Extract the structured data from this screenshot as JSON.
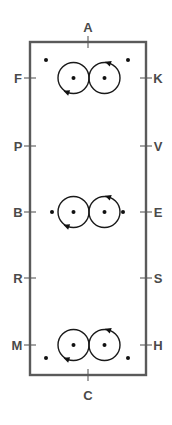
{
  "diagram": {
    "title_top_label": "A",
    "title_bottom_label": "C",
    "frame": {
      "x": 30,
      "y": 42,
      "width": 116,
      "height": 333,
      "stroke_color": "#5a5a5a",
      "stroke_width": 2.4
    },
    "colors": {
      "frame": "#5a5a5a",
      "label_text": "#4a4a4a",
      "circle_stroke": "#1a1a1a",
      "dot_fill": "#111111",
      "background": "#ffffff"
    },
    "edge_markers": [
      {
        "name": "top-marker-A",
        "label": "A",
        "side": "top",
        "x": 88,
        "y": 42,
        "label_x": 88,
        "label_y": 32
      },
      {
        "name": "bottom-marker-C",
        "label": "C",
        "side": "bottom",
        "x": 88,
        "y": 375,
        "label_x": 88,
        "label_y": 400
      }
    ],
    "left_markers": [
      {
        "name": "left-marker-F",
        "label": "F",
        "y": 78,
        "label_x": 18,
        "label_y": 83
      },
      {
        "name": "left-marker-P",
        "label": "P",
        "y": 146,
        "label_x": 18,
        "label_y": 151
      },
      {
        "name": "left-marker-B",
        "label": "B",
        "y": 212,
        "label_x": 18,
        "label_y": 217
      },
      {
        "name": "left-marker-R",
        "label": "R",
        "y": 278,
        "label_x": 18,
        "label_y": 283
      },
      {
        "name": "left-marker-M",
        "label": "M",
        "y": 345,
        "label_x": 17,
        "label_y": 350
      }
    ],
    "right_markers": [
      {
        "name": "right-marker-K",
        "label": "K",
        "y": 78,
        "label_x": 158,
        "label_y": 83
      },
      {
        "name": "right-marker-V",
        "label": "V",
        "y": 146,
        "label_x": 158,
        "label_y": 151
      },
      {
        "name": "right-marker-E",
        "label": "E",
        "y": 212,
        "label_x": 158,
        "label_y": 217
      },
      {
        "name": "right-marker-S",
        "label": "S",
        "y": 278,
        "label_x": 158,
        "label_y": 283
      },
      {
        "name": "right-marker-H",
        "label": "H",
        "y": 345,
        "label_x": 158,
        "label_y": 350
      }
    ],
    "circle_pairs": [
      {
        "name": "circle-pair-top",
        "row_label_left": "F",
        "row_label_right": "K",
        "cy": 78,
        "left_circle": {
          "cx": 73.5,
          "cy": 78,
          "r": 15.5,
          "center_dot": true,
          "rotation": "clockwise",
          "arrow_angle_deg": 110
        },
        "right_circle": {
          "cx": 104.5,
          "cy": 78,
          "r": 15.5,
          "center_dot": true,
          "rotation": "counterclockwise",
          "arrow_angle_deg": 290
        }
      },
      {
        "name": "circle-pair-middle",
        "row_label_left": "B",
        "row_label_right": "E",
        "cy": 212,
        "left_circle": {
          "cx": 73.5,
          "cy": 212,
          "r": 15.5,
          "center_dot": true,
          "rotation": "clockwise",
          "arrow_angle_deg": 110
        },
        "right_circle": {
          "cx": 104.5,
          "cy": 212,
          "r": 15.5,
          "center_dot": true,
          "rotation": "counterclockwise",
          "arrow_angle_deg": 290
        }
      },
      {
        "name": "circle-pair-bottom",
        "row_label_left": "M",
        "row_label_right": "H",
        "cy": 345,
        "left_circle": {
          "cx": 73.5,
          "cy": 345,
          "r": 15.5,
          "center_dot": true,
          "rotation": "clockwise",
          "arrow_angle_deg": 110
        },
        "right_circle": {
          "cx": 104.5,
          "cy": 345,
          "r": 15.5,
          "center_dot": true,
          "rotation": "counterclockwise",
          "arrow_angle_deg": 290
        }
      }
    ],
    "free_dots": [
      {
        "name": "free-dot-top-left",
        "cx": 46,
        "cy": 60,
        "r": 2.0
      },
      {
        "name": "free-dot-top-right",
        "cx": 128,
        "cy": 60,
        "r": 2.0
      },
      {
        "name": "free-dot-middle-outer-left",
        "cx": 52,
        "cy": 212,
        "r": 2.0
      },
      {
        "name": "free-dot-middle-outer-right",
        "cx": 123,
        "cy": 212,
        "r": 2.0
      },
      {
        "name": "free-dot-bottom-left",
        "cx": 46,
        "cy": 358,
        "r": 2.0
      },
      {
        "name": "free-dot-bottom-right",
        "cx": 128,
        "cy": 358,
        "r": 2.0
      }
    ],
    "center_dots": [
      {
        "name": "center-dot-top-left",
        "cx": 73.5,
        "cy": 78,
        "r": 2.0
      },
      {
        "name": "center-dot-top-right",
        "cx": 104.5,
        "cy": 78,
        "r": 2.0
      },
      {
        "name": "center-dot-middle-left",
        "cx": 73.5,
        "cy": 212,
        "r": 2.0
      },
      {
        "name": "center-dot-middle-right",
        "cx": 104.5,
        "cy": 212,
        "r": 2.0
      },
      {
        "name": "center-dot-bottom-left",
        "cx": 73.5,
        "cy": 345,
        "r": 2.0
      },
      {
        "name": "center-dot-bottom-right",
        "cx": 104.5,
        "cy": 345,
        "r": 2.0
      }
    ]
  }
}
